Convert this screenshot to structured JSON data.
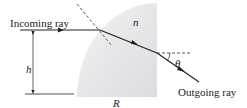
{
  "diagram": {
    "labels": {
      "incoming": "Incoming ray",
      "outgoing": "Outgoing ray",
      "height": "h",
      "radius": "R",
      "index": "n",
      "angle": "θ"
    },
    "colors": {
      "lens_fill": "#e4e4e6",
      "line": "#222222"
    }
  }
}
